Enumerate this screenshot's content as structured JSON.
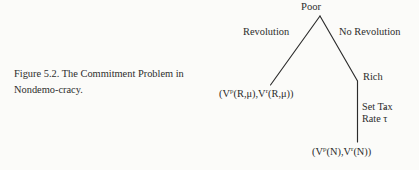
{
  "figure": {
    "background_color": "#fbfbf9",
    "ink_color": "#2c2c2c",
    "caption": {
      "line1": "Figure 5.2.  The Commitment Problem in",
      "line2": "Nondemo-cracy."
    },
    "tree": {
      "type": "game-tree",
      "root_node": "Poor",
      "decision_nodes": [
        {
          "name": "Poor",
          "label": "Poor"
        },
        {
          "name": "Rich",
          "label": "Rich"
        }
      ],
      "edges": [
        {
          "from": "Poor",
          "label": "Revolution",
          "to": "payoff_revolution"
        },
        {
          "from": "Poor",
          "label": "No Revolution",
          "to": "Rich"
        },
        {
          "from": "Rich",
          "label_line1": "Set Tax",
          "label_line2_prefix": "Rate ",
          "label_line2_symbol": "τ",
          "label_line2_accent": "ˆ",
          "to": "payoff_no_revolution"
        }
      ],
      "labels": {
        "poor": "Poor",
        "revolution": "Revolution",
        "no_revolution": "No Revolution",
        "rich": "Rich",
        "set_tax": "Set Tax",
        "rate_prefix": "Rate ",
        "tau": "τ",
        "tau_hat_accent": "ˆ"
      },
      "payoffs": {
        "revolution": {
          "open": "(V",
          "sup1": "p",
          "mid": "(R,μ),V",
          "sup2": "r",
          "close": "(R,μ))"
        },
        "no_revolution": {
          "open": "(V",
          "sup1": "p",
          "mid": "(N),V",
          "sup2": "r",
          "close": "(N))"
        }
      }
    }
  }
}
